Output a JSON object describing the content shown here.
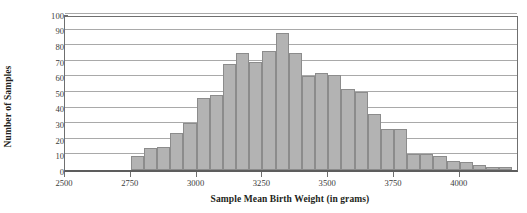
{
  "chart_data": {
    "type": "bar",
    "title": "",
    "subtitle": "",
    "xlabel": "Sample Mean Birth Weight (in grams)",
    "ylabel": "Number of Samples",
    "grid": true,
    "legend": null,
    "bin_width": 50,
    "xlim": [
      2500,
      4225
    ],
    "ylim": [
      0,
      100
    ],
    "x_ticks": [
      2500,
      2750,
      3000,
      3250,
      3500,
      3750,
      4000
    ],
    "y_ticks": [
      0,
      10,
      20,
      30,
      40,
      50,
      60,
      70,
      80,
      90,
      100
    ],
    "bin_starts": [
      2500,
      2550,
      2600,
      2650,
      2700,
      2750,
      2800,
      2850,
      2900,
      2950,
      3000,
      3050,
      3100,
      3150,
      3200,
      3250,
      3300,
      3350,
      3400,
      3450,
      3500,
      3550,
      3600,
      3650,
      3700,
      3750,
      3800,
      3850,
      3900,
      3950,
      4000,
      4050,
      4100,
      4150
    ],
    "categories": [
      "2500-2550",
      "2550-2600",
      "2600-2650",
      "2650-2700",
      "2700-2750",
      "2750-2800",
      "2800-2850",
      "2850-2900",
      "2900-2950",
      "2950-3000",
      "3000-3050",
      "3050-3100",
      "3100-3150",
      "3150-3200",
      "3200-3250",
      "3250-3300",
      "3300-3350",
      "3350-3400",
      "3400-3450",
      "3450-3500",
      "3500-3550",
      "3550-3600",
      "3600-3650",
      "3650-3700",
      "3700-3750",
      "3750-3800",
      "3800-3850",
      "3850-3900",
      "3900-3950",
      "3950-4000",
      "4000-4050",
      "4050-4100",
      "4100-4150",
      "4150-4200"
    ],
    "values": [
      0,
      0,
      0,
      0,
      0,
      9,
      14,
      15,
      24,
      30,
      46,
      48,
      68,
      75,
      69,
      76,
      88,
      75,
      60,
      62,
      61,
      52,
      50,
      36,
      26,
      26,
      10,
      10,
      9,
      6,
      5,
      3,
      2,
      2
    ],
    "bar_color": "#b3b3b3",
    "bar_edge_color": "#8c8c8c",
    "grid_color": "#a9a9a9",
    "axis_color": "#6f6f6f",
    "text_color": "#3a3a3a",
    "background": "#ffffff",
    "peak_value": 88,
    "peak_bin": "3300-3350"
  }
}
